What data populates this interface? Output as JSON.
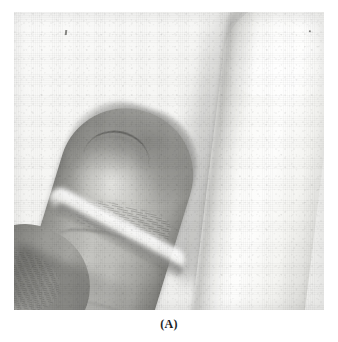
{
  "figure": {
    "caption": "(A)",
    "alt_description": "Black-and-white clinical photograph of two fingertips shown in profile against a pale background; the near finger is in sharp focus showing the nail fold and flexion creases, the far finger is overexposed and out of focus.",
    "media_type": "grayscale photograph",
    "colors": {
      "page_background": "#ffffff",
      "photo_background": "#f4f4f2",
      "near_finger_midtone": "#b0b0ac",
      "near_finger_shadow": "#636360",
      "far_finger_highlight": "#fdfdfc",
      "cast_shadow": "#80807e",
      "caption_text": "#1d1d1d"
    },
    "plate": {
      "left": 14,
      "top": 12,
      "width": 310,
      "height": 298
    },
    "subjects": [
      {
        "name": "near-finger",
        "label": "near fingertip in focus",
        "position": "left-center",
        "features": [
          "nail-fold-crease",
          "distal-pulp-highlight",
          "flexion-creases",
          "fingerprint-ridges"
        ]
      },
      {
        "name": "far-finger",
        "label": "far fingertip, overexposed and defocused",
        "position": "right",
        "features": [
          "soft-cast-shadow",
          "blown-highlight"
        ]
      },
      {
        "name": "adjacent-finger",
        "label": "adjacent finger partially visible",
        "position": "bottom-left",
        "features": [
          "fingerprint-ridges",
          "web-space-shadow"
        ]
      }
    ]
  }
}
